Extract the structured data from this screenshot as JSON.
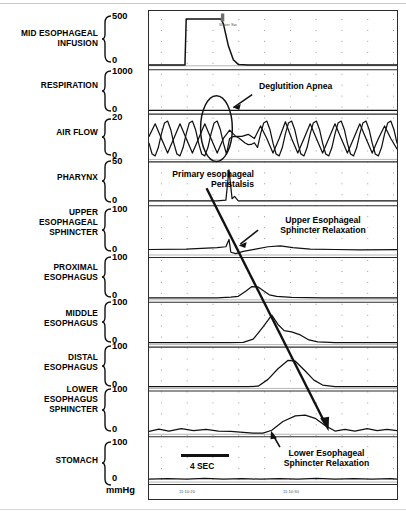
{
  "figure": {
    "type": "multichannel-manometry-tracing",
    "units_label": "mmHg",
    "scale_bar_label": "4 SEC",
    "event_marker_label": "Water Sw"
  },
  "channels": [
    {
      "name": "MID ESOPHAGEAL\nINFUSION",
      "hi": "500",
      "lo": "0"
    },
    {
      "name": "RESPIRATION",
      "hi": "1000",
      "lo": "0"
    },
    {
      "name": "AIR FLOW",
      "hi": "20",
      "lo": "0"
    },
    {
      "name": "PHARYNX",
      "hi": "50",
      "lo": "0"
    },
    {
      "name": "UPPER\nESOPHAGEAL\nSPHINCTER",
      "hi": "100",
      "lo": "0"
    },
    {
      "name": "PROXIMAL\nESOPHAGUS",
      "hi": "100",
      "lo": "0"
    },
    {
      "name": "MIDDLE\nESOPHAGUS",
      "hi": "100",
      "lo": "0"
    },
    {
      "name": "DISTAL\nESOPHAGUS",
      "hi": "100",
      "lo": "0"
    },
    {
      "name": "LOWER\nESOPHAGUS\nSPHINCTER",
      "hi": "100",
      "lo": "0"
    },
    {
      "name": "STOMACH",
      "hi": "100",
      "lo": "0"
    }
  ],
  "annotations": {
    "deglutition_apnea": "Deglutition Apnea",
    "primary_peristalsis": "Primary esophageal\nPeristalsis",
    "ues_relaxation": "Upper Esophageal\nSphincter Relaxation",
    "les_relaxation": "Lower Esophageal\nSphincter Relaxation"
  },
  "time_axis": {
    "ticks": [
      "11:10:20",
      "11:10:30"
    ]
  },
  "chart_data": {
    "type": "line",
    "xlabel": "Time",
    "ylabel": "Pressure (mmHg)",
    "x_range_seconds": [
      0,
      20
    ],
    "grid": "dotted",
    "legend": "none",
    "time_tick_labels": [
      "11:10:20",
      "11:10:30"
    ],
    "scale_bar_seconds": 4,
    "series": [
      {
        "name": "MID ESOPHAGEAL INFUSION",
        "ylim": [
          0,
          500
        ],
        "units": "mL/min",
        "description": "square pulse on from ~3.0s to ~6.2s then decays to baseline",
        "points": [
          [
            0,
            8
          ],
          [
            2.9,
            8
          ],
          [
            3.0,
            470
          ],
          [
            5.8,
            470
          ],
          [
            6.0,
            420
          ],
          [
            6.4,
            200
          ],
          [
            6.8,
            60
          ],
          [
            7.2,
            14
          ],
          [
            8,
            8
          ],
          [
            20,
            8
          ]
        ]
      },
      {
        "name": "RESPIRATION",
        "ylim": [
          0,
          1000
        ],
        "units": "mL",
        "description": "flat baseline trace",
        "points": [
          [
            0,
            30
          ],
          [
            20,
            30
          ]
        ]
      },
      {
        "name": "AIR FLOW",
        "ylim": [
          0,
          20
        ],
        "units": "L/min",
        "description": "regular respiratory oscillation interrupted by deglutition apnea at ~6.5-8.5s",
        "points": [
          [
            0,
            11
          ],
          [
            0.5,
            17
          ],
          [
            1.0,
            10
          ],
          [
            1.5,
            3
          ],
          [
            2.0,
            10
          ],
          [
            2.5,
            17
          ],
          [
            3.0,
            10
          ],
          [
            3.5,
            3
          ],
          [
            4.0,
            10
          ],
          [
            4.5,
            17
          ],
          [
            5.0,
            10
          ],
          [
            5.5,
            3
          ],
          [
            6.0,
            10
          ],
          [
            6.5,
            14
          ],
          [
            7.0,
            11
          ],
          [
            7.5,
            11
          ],
          [
            8.0,
            12
          ],
          [
            8.5,
            10
          ],
          [
            9.0,
            16
          ],
          [
            9.5,
            10
          ],
          [
            10.0,
            3
          ],
          [
            10.5,
            10
          ],
          [
            11.0,
            18
          ],
          [
            11.5,
            10
          ],
          [
            12.0,
            3
          ],
          [
            12.5,
            10
          ],
          [
            13.0,
            17
          ],
          [
            13.5,
            10
          ],
          [
            14.0,
            3
          ],
          [
            14.5,
            10
          ],
          [
            15.0,
            17
          ],
          [
            15.5,
            10
          ],
          [
            16.0,
            3
          ],
          [
            16.5,
            10
          ],
          [
            17.0,
            17
          ],
          [
            17.5,
            10
          ],
          [
            18.0,
            3
          ],
          [
            18.5,
            10
          ],
          [
            19.0,
            16
          ],
          [
            19.5,
            10
          ],
          [
            20,
            5
          ]
        ]
      },
      {
        "name": "PHARYNX",
        "ylim": [
          0,
          50
        ],
        "units": "mmHg",
        "description": "sharp pharyngeal contraction spike at ~6.5s",
        "points": [
          [
            0,
            3
          ],
          [
            5.5,
            3
          ],
          [
            6.2,
            4
          ],
          [
            6.45,
            44
          ],
          [
            6.7,
            6
          ],
          [
            6.9,
            9
          ],
          [
            7.2,
            3
          ],
          [
            20,
            3
          ]
        ]
      },
      {
        "name": "UPPER ESOPHAGEAL SPHINCTER",
        "ylim": [
          0,
          100
        ],
        "units": "mmHg",
        "description": "resting tone, brief spike then relaxation nadir at ~6.8s, post-relaxation rise",
        "points": [
          [
            0,
            12
          ],
          [
            3,
            13
          ],
          [
            5.5,
            16
          ],
          [
            6.2,
            18
          ],
          [
            6.45,
            34
          ],
          [
            6.6,
            6
          ],
          [
            7.0,
            3
          ],
          [
            7.6,
            8
          ],
          [
            8.6,
            13
          ],
          [
            9.6,
            18
          ],
          [
            10.6,
            20
          ],
          [
            11.6,
            16
          ],
          [
            13,
            13
          ],
          [
            15,
            12
          ],
          [
            17,
            11
          ],
          [
            20,
            12
          ]
        ]
      },
      {
        "name": "PROXIMAL ESOPHAGUS",
        "ylim": [
          0,
          100
        ],
        "units": "mmHg",
        "description": "peristaltic contraction peak at ~8.5s",
        "points": [
          [
            0,
            5
          ],
          [
            5.5,
            5
          ],
          [
            6.6,
            7
          ],
          [
            7.2,
            9
          ],
          [
            7.8,
            22
          ],
          [
            8.3,
            34
          ],
          [
            8.8,
            33
          ],
          [
            9.2,
            24
          ],
          [
            9.7,
            13
          ],
          [
            10.3,
            9
          ],
          [
            11.5,
            6
          ],
          [
            14,
            5
          ],
          [
            20,
            5
          ]
        ]
      },
      {
        "name": "MIDDLE ESOPHAGUS",
        "ylim": [
          0,
          100
        ],
        "units": "mmHg",
        "description": "peristaltic contraction peak at ~10.0s, later than proximal",
        "points": [
          [
            0,
            5
          ],
          [
            6.5,
            5
          ],
          [
            7.6,
            6
          ],
          [
            8.4,
            14
          ],
          [
            9.2,
            46
          ],
          [
            9.9,
            76
          ],
          [
            10.4,
            52
          ],
          [
            10.9,
            36
          ],
          [
            11.5,
            33
          ],
          [
            12.2,
            25
          ],
          [
            12.9,
            12
          ],
          [
            13.6,
            7
          ],
          [
            15,
            5
          ],
          [
            20,
            5
          ]
        ]
      },
      {
        "name": "DISTAL ESOPHAGUS",
        "ylim": [
          0,
          100
        ],
        "units": "mmHg",
        "description": "peristaltic contraction peak at ~11.5s, latest esophageal body wave",
        "points": [
          [
            0,
            5
          ],
          [
            8.0,
            5
          ],
          [
            8.8,
            6
          ],
          [
            9.6,
            24
          ],
          [
            10.4,
            52
          ],
          [
            11.2,
            74
          ],
          [
            11.8,
            72
          ],
          [
            12.6,
            46
          ],
          [
            13.3,
            22
          ],
          [
            14.0,
            9
          ],
          [
            15,
            5
          ],
          [
            20,
            5
          ]
        ]
      },
      {
        "name": "LOWER ESOPHAGUS SPHINCTER",
        "ylim": [
          0,
          100
        ],
        "units": "mmHg",
        "description": "relaxation nadir from ~8.5s then after-contraction peak at ~12.5s",
        "points": [
          [
            0,
            7
          ],
          [
            0.8,
            13
          ],
          [
            1.6,
            8
          ],
          [
            2.6,
            14
          ],
          [
            3.6,
            9
          ],
          [
            4.6,
            12
          ],
          [
            5.6,
            8
          ],
          [
            6.6,
            7
          ],
          [
            7.6,
            5
          ],
          [
            8.4,
            3
          ],
          [
            9.2,
            3
          ],
          [
            9.9,
            10
          ],
          [
            10.8,
            32
          ],
          [
            11.8,
            46
          ],
          [
            12.6,
            48
          ],
          [
            13.4,
            40
          ],
          [
            14.2,
            22
          ],
          [
            15.0,
            8
          ],
          [
            15.8,
            12
          ],
          [
            16.6,
            8
          ],
          [
            17.6,
            14
          ],
          [
            18.4,
            9
          ],
          [
            19.2,
            12
          ],
          [
            20,
            9
          ]
        ]
      },
      {
        "name": "STOMACH",
        "ylim": [
          0,
          100
        ],
        "units": "mmHg",
        "description": "stable intragastric baseline with minor respiratory ripple",
        "points": [
          [
            0,
            7
          ],
          [
            1.5,
            8
          ],
          [
            3,
            7
          ],
          [
            4.5,
            9
          ],
          [
            6,
            7
          ],
          [
            7.5,
            8
          ],
          [
            9,
            7
          ],
          [
            10.5,
            8
          ],
          [
            12,
            7
          ],
          [
            13.5,
            9
          ],
          [
            15,
            7
          ],
          [
            16.5,
            8
          ],
          [
            18,
            7
          ],
          [
            19.5,
            8
          ],
          [
            20,
            7
          ]
        ]
      }
    ],
    "annotations": [
      {
        "text": "Deglutition Apnea",
        "target_series": "AIR FLOW",
        "target_time_s": 7.4,
        "marker": "ellipse-with-arrow"
      },
      {
        "text": "Primary esophageal Peristalsis",
        "marker": "long-diagonal-arrow",
        "from_series": "PHARYNX",
        "to_series": "LOWER ESOPHAGUS SPHINCTER"
      },
      {
        "text": "Upper Esophageal Sphincter Relaxation",
        "target_series": "UPPER ESOPHAGEAL SPHINCTER",
        "target_time_s": 6.9,
        "marker": "arrow"
      },
      {
        "text": "Lower Esophageal Sphincter Relaxation",
        "target_series": "LOWER ESOPHAGUS SPHINCTER",
        "target_time_s": 9.0,
        "marker": "arrow"
      },
      {
        "text": "Water Sw",
        "target_series": "MID ESOPHAGEAL INFUSION",
        "target_time_s": 6.3,
        "marker": "event-tick"
      }
    ]
  }
}
